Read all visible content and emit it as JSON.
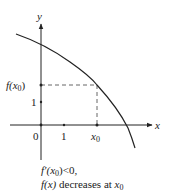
{
  "diagram": {
    "type": "function-graph",
    "axes": {
      "x_label": "x",
      "y_label": "y",
      "origin_label": "0",
      "x_ticks": [
        {
          "label": "1",
          "value": 1
        },
        {
          "label": "x0",
          "value": "x0"
        }
      ],
      "y_ticks": [
        {
          "label": "1",
          "value": 1
        },
        {
          "label": "f(x0)",
          "value": "f(x0)"
        }
      ]
    },
    "curve": {
      "description": "decreasing concave-down curve f(x)",
      "marked_point": "(x0, f(x0))"
    },
    "labels": {
      "y_axis": "y",
      "x_axis": "x",
      "origin": "0",
      "x_tick_1": "1",
      "x_tick_x0_base": "x",
      "x_tick_x0_sub": "0",
      "y_tick_1": "1",
      "y_tick_fx0_prefix": "f(x",
      "y_tick_fx0_sub": "0",
      "y_tick_fx0_suffix": ")"
    },
    "caption": {
      "line1": "f′(x0)<0,",
      "line1_parts": {
        "pre": "f′(x",
        "sub": "0",
        "post": ")<0,"
      },
      "line2": "f(x) decreases at x0",
      "line2_parts": {
        "fx": "f(x)",
        "mid": " decreases at ",
        "x": "x",
        "sub": "0"
      }
    },
    "colors": {
      "ink": "#222222",
      "dashed": "#555555",
      "background": "#ffffff"
    }
  }
}
